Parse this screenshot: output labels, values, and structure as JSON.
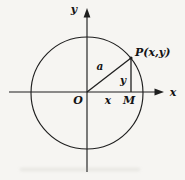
{
  "figure": {
    "colors": {
      "background": "#f6f5f2",
      "ink": "#1f1f1f"
    },
    "labels": {
      "y_axis": "y",
      "x_axis": "x",
      "origin": "O",
      "point": "P(x,y)",
      "radius": "a",
      "ordinate": "y",
      "abscissa": "x",
      "foot": "M"
    }
  }
}
